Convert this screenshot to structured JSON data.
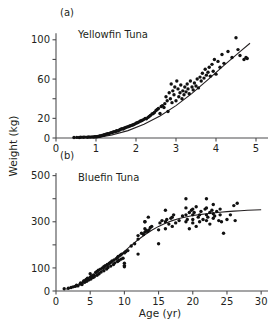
{
  "figure": {
    "axis_label_y": "Weight (kg)",
    "axis_label_x": "Age (yr)",
    "background": "#ffffff",
    "foreground": "#231f20"
  },
  "panels": {
    "a": {
      "tag": "(a)",
      "title": "Yellowfin Tuna"
    },
    "b": {
      "tag": "(b)",
      "title": "Bluefin Tuna"
    }
  },
  "chart_data": [
    {
      "type": "scatter",
      "id": "panel-a",
      "title": "Yellowfin Tuna",
      "panel_tag": "(a)",
      "xlabel": "",
      "ylabel": "Weight (kg)",
      "xlim": [
        0,
        5.3
      ],
      "ylim": [
        0,
        112
      ],
      "xticks": [
        0,
        1,
        2,
        3,
        4,
        5
      ],
      "xticklabels": [
        "0",
        "1",
        "2",
        "3",
        "4",
        "5"
      ],
      "yticks": [
        0,
        20,
        40,
        60,
        80,
        100
      ],
      "yticklabels": [
        "0",
        "20",
        "",
        "60",
        "",
        "100"
      ],
      "grid": false,
      "legend": "none",
      "marker": "filled-circle",
      "marker_color": "#111111",
      "fit_color": "#231f20",
      "fit_label": "fitted growth curve",
      "fit_curve": [
        [
          1.05,
          0.5
        ],
        [
          1.4,
          3.0
        ],
        [
          1.8,
          7.5
        ],
        [
          2.2,
          14.0
        ],
        [
          2.6,
          22.5
        ],
        [
          3.0,
          33.0
        ],
        [
          3.4,
          45.5
        ],
        [
          3.8,
          59.5
        ],
        [
          4.2,
          74.0
        ],
        [
          4.6,
          88.0
        ],
        [
          4.85,
          96.5
        ]
      ],
      "x": [
        0.45,
        0.52,
        0.58,
        0.62,
        0.68,
        0.72,
        0.78,
        0.82,
        0.86,
        0.9,
        0.94,
        0.97,
        1.0,
        1.02,
        1.05,
        1.08,
        1.1,
        1.12,
        1.15,
        1.18,
        1.2,
        1.22,
        1.25,
        1.28,
        1.3,
        1.32,
        1.35,
        1.38,
        1.4,
        1.42,
        1.45,
        1.48,
        1.5,
        1.52,
        1.55,
        1.58,
        1.6,
        1.62,
        1.65,
        1.68,
        1.7,
        1.73,
        1.76,
        1.8,
        1.83,
        1.86,
        1.9,
        1.93,
        1.96,
        2.0,
        2.03,
        2.06,
        2.1,
        2.13,
        2.16,
        2.2,
        2.23,
        2.26,
        2.3,
        2.33,
        2.36,
        2.4,
        2.43,
        2.46,
        2.5,
        2.53,
        2.56,
        2.6,
        2.63,
        2.66,
        2.7,
        2.72,
        2.75,
        2.78,
        2.8,
        2.83,
        2.86,
        2.88,
        2.9,
        2.92,
        2.95,
        2.97,
        3.0,
        3.02,
        3.05,
        3.07,
        3.1,
        3.12,
        3.15,
        3.17,
        3.2,
        3.22,
        3.25,
        3.28,
        3.3,
        3.33,
        3.36,
        3.4,
        3.43,
        3.46,
        3.5,
        3.53,
        3.56,
        3.6,
        3.63,
        3.66,
        3.7,
        3.73,
        3.76,
        3.8,
        3.83,
        3.86,
        3.9,
        3.93,
        3.96,
        4.0,
        4.05,
        4.1,
        4.15,
        4.2,
        4.3,
        4.4,
        4.5,
        4.55,
        4.6,
        4.7,
        4.75,
        4.78
      ],
      "y": [
        0.5,
        0.6,
        0.5,
        0.8,
        0.7,
        0.9,
        0.8,
        1.0,
        0.9,
        1.1,
        1.0,
        1.2,
        1.4,
        1.3,
        1.6,
        1.8,
        2.0,
        2.2,
        2.5,
        2.8,
        3.0,
        3.4,
        3.8,
        4.0,
        4.5,
        4.2,
        5.0,
        5.5,
        5.2,
        6.0,
        6.5,
        6.2,
        7.0,
        7.5,
        7.2,
        8.0,
        8.5,
        9.0,
        9.5,
        9.2,
        10.0,
        10.5,
        11.0,
        11.5,
        12.0,
        12.5,
        13.0,
        13.5,
        14.0,
        15.0,
        15.5,
        16.0,
        17.0,
        17.5,
        18.0,
        19.0,
        20.0,
        19.5,
        21.0,
        22.0,
        23.0,
        24.5,
        25.0,
        26.0,
        28.0,
        29.0,
        30.0,
        25.0,
        32.0,
        33.0,
        31.0,
        35.0,
        42.0,
        38.0,
        27.0,
        46.0,
        40.0,
        55.0,
        36.0,
        48.0,
        44.0,
        52.0,
        38.0,
        58.0,
        50.0,
        42.0,
        46.0,
        54.0,
        40.0,
        48.0,
        44.0,
        52.0,
        47.0,
        55.0,
        50.0,
        45.0,
        58.0,
        52.0,
        49.0,
        56.0,
        53.0,
        60.0,
        51.0,
        62.0,
        58.0,
        66.0,
        61.0,
        70.0,
        64.0,
        67.0,
        72.0,
        63.0,
        75.0,
        68.0,
        80.0,
        65.0,
        78.0,
        72.0,
        85.0,
        76.0,
        88.0,
        82.0,
        102.0,
        90.0,
        84.0,
        80.0,
        82.0,
        81.0
      ]
    },
    {
      "type": "scatter",
      "id": "panel-b",
      "title": "Bluefin Tuna",
      "panel_tag": "(b)",
      "xlabel": "Age (yr)",
      "ylabel": "Weight (kg)",
      "xlim": [
        0,
        31
      ],
      "ylim": [
        0,
        520
      ],
      "xticks": [
        0,
        5,
        10,
        15,
        20,
        25,
        30
      ],
      "xticklabels": [
        "0",
        "5",
        "10",
        "15",
        "20",
        "25",
        "30"
      ],
      "yticks": [
        0,
        100,
        200,
        300,
        400,
        500
      ],
      "yticklabels": [
        "0",
        "100",
        "",
        "300",
        "",
        "500"
      ],
      "grid": false,
      "legend": "none",
      "marker": "filled-circle",
      "marker_color": "#111111",
      "fit_color": "#231f20",
      "fit_label": "fitted von Bertalanffy curve",
      "fit_curve": [
        [
          1.5,
          8
        ],
        [
          3,
          22
        ],
        [
          4,
          35
        ],
        [
          5,
          52
        ],
        [
          6,
          72
        ],
        [
          7,
          95
        ],
        [
          8,
          120
        ],
        [
          9,
          146
        ],
        [
          10,
          172
        ],
        [
          11,
          198
        ],
        [
          12,
          222
        ],
        [
          13,
          244
        ],
        [
          14,
          263
        ],
        [
          15,
          280
        ],
        [
          16,
          294
        ],
        [
          17,
          305
        ],
        [
          18,
          314
        ],
        [
          19,
          321
        ],
        [
          20,
          327
        ],
        [
          21,
          331
        ],
        [
          22,
          335
        ],
        [
          23,
          338
        ],
        [
          24,
          341
        ],
        [
          25,
          344
        ],
        [
          26,
          346
        ],
        [
          27,
          348
        ],
        [
          28,
          350
        ],
        [
          29,
          351
        ],
        [
          30,
          352
        ]
      ],
      "x": [
        1.2,
        1.8,
        2.2,
        2.5,
        2.8,
        3.0,
        3.2,
        3.5,
        3.6,
        3.8,
        4.0,
        4.1,
        4.2,
        4.4,
        4.5,
        4.6,
        4.8,
        5.0,
        5.0,
        5.1,
        5.2,
        5.4,
        5.5,
        5.6,
        5.8,
        6.0,
        6.0,
        6.2,
        6.3,
        6.5,
        6.6,
        6.8,
        7.0,
        7.0,
        7.2,
        7.4,
        7.5,
        7.6,
        7.8,
        8.0,
        8.0,
        8.2,
        8.4,
        8.5,
        8.6,
        8.8,
        9.0,
        9.0,
        9.1,
        9.2,
        9.4,
        9.5,
        9.6,
        9.8,
        10.0,
        10.0,
        10.0,
        10.2,
        10.5,
        11.0,
        11.5,
        12.0,
        12.0,
        12.5,
        12.8,
        13.0,
        13.0,
        13.0,
        13.2,
        13.4,
        13.5,
        13.6,
        13.8,
        14.0,
        15.0,
        15.2,
        15.5,
        16.0,
        16.0,
        16.0,
        16.2,
        16.5,
        16.8,
        17.0,
        17.0,
        17.2,
        17.5,
        18.0,
        18.5,
        19.0,
        19.0,
        19.0,
        19.0,
        19.2,
        19.5,
        19.5,
        19.8,
        20.0,
        20.0,
        20.0,
        20.0,
        20.2,
        20.5,
        20.5,
        20.8,
        21.0,
        21.0,
        21.2,
        21.5,
        21.8,
        22.0,
        22.0,
        22.0,
        22.0,
        22.2,
        22.5,
        22.5,
        22.8,
        23.0,
        23.0,
        23.0,
        23.2,
        23.5,
        23.8,
        24.0,
        24.0,
        24.2,
        24.5,
        25.0,
        25.5,
        26.0,
        26.2,
        26.5,
        12.0,
        15.0,
        10.0,
        13.0
      ],
      "y": [
        10,
        12,
        15,
        18,
        20,
        25,
        22,
        30,
        35,
        28,
        40,
        45,
        38,
        50,
        42,
        55,
        48,
        60,
        75,
        52,
        65,
        58,
        70,
        62,
        80,
        85,
        68,
        90,
        75,
        95,
        82,
        100,
        105,
        88,
        110,
        95,
        115,
        102,
        120,
        125,
        108,
        130,
        115,
        135,
        122,
        140,
        145,
        128,
        150,
        132,
        155,
        138,
        160,
        142,
        165,
        105,
        110,
        170,
        175,
        195,
        205,
        240,
        225,
        250,
        245,
        270,
        255,
        300,
        262,
        258,
        320,
        265,
        275,
        280,
        265,
        295,
        305,
        300,
        270,
        350,
        310,
        290,
        315,
        320,
        280,
        330,
        295,
        305,
        325,
        300,
        330,
        360,
        400,
        310,
        340,
        270,
        350,
        310,
        330,
        355,
        295,
        340,
        365,
        280,
        320,
        330,
        300,
        345,
        310,
        355,
        305,
        330,
        360,
        400,
        320,
        340,
        290,
        350,
        315,
        335,
        375,
        325,
        345,
        305,
        330,
        355,
        300,
        250,
        310,
        330,
        370,
        305,
        380,
        160,
        205,
        120,
        300
      ]
    }
  ]
}
